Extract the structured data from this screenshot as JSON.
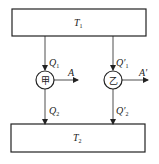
{
  "diagram": {
    "top_reservoir": {
      "label": "T",
      "sub": "1"
    },
    "bottom_reservoir": {
      "label": "T",
      "sub": "2"
    },
    "engine_left": {
      "name": "甲",
      "heat_in": {
        "label": "Q",
        "sub": "1"
      },
      "work_out": {
        "label": "A"
      },
      "heat_out": {
        "label": "Q",
        "sub": "2"
      }
    },
    "engine_right": {
      "name": "乙",
      "heat_in": {
        "label": "Q′",
        "sub": "1"
      },
      "work_out": {
        "label": "A′"
      },
      "heat_out": {
        "label": "Q′",
        "sub": "2"
      }
    },
    "colors": {
      "stroke": "#222222",
      "background": "#ffffff"
    }
  }
}
